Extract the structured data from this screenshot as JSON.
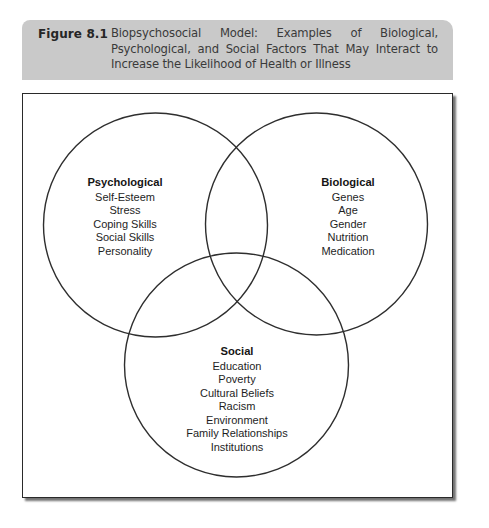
{
  "figure": {
    "label": "Figure 8.1",
    "caption": "Biopsychosocial Model: Examples of Biological, Psychological, and Social Factors That May Interact to Increase the Likelihood of Health or Illness"
  },
  "diagram": {
    "type": "venn",
    "sets": [
      {
        "name": "Psychological",
        "items": [
          "Self-Esteem",
          "Stress",
          "Coping Skills",
          "Social Skills",
          "Personality"
        ]
      },
      {
        "name": "Biological",
        "items": [
          "Genes",
          "Age",
          "Gender",
          "Nutrition",
          "Medication"
        ]
      },
      {
        "name": "Social",
        "items": [
          "Education",
          "Poverty",
          "Cultural Beliefs",
          "Racism",
          "Environment",
          "Family Relationships",
          "Institutions"
        ]
      }
    ]
  }
}
